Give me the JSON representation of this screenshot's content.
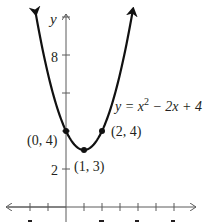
{
  "chart_data": {
    "type": "line",
    "title": "",
    "xlabel": "",
    "ylabel": "y",
    "equation_label": "y = x² − 2x + 4",
    "function": "x^2 - 2x + 4",
    "x_range": [
      -1.7,
      3.7
    ],
    "xlim": [
      -3.4,
      7.2
    ],
    "ylim": [
      -0.8,
      11
    ],
    "x_ticks": [
      -2,
      -1,
      1,
      2,
      3,
      4,
      5,
      6
    ],
    "y_ticks": [
      2,
      4,
      6,
      8,
      10
    ],
    "y_tick_labels": [
      {
        "value": 2,
        "label": "2"
      },
      {
        "value": 8,
        "label": "8"
      }
    ],
    "grid": false,
    "series": [
      {
        "name": "y = x² − 2x + 4",
        "x": [
          -1.5,
          -1,
          0,
          1,
          2,
          3,
          3.5
        ],
        "values": [
          9.25,
          7,
          4,
          3,
          4,
          7,
          9.25
        ]
      }
    ],
    "points": [
      {
        "x": 0,
        "y": 4,
        "label": "(0, 4)"
      },
      {
        "x": 1,
        "y": 3,
        "label": "(1, 3)"
      },
      {
        "x": 2,
        "y": 4,
        "label": "(2, 4)"
      }
    ]
  },
  "labels": {
    "y_axis": "y",
    "tick_8": "8",
    "tick_2": "2",
    "equation": "y = x",
    "equation_exp": "2",
    "equation_rest": " − 2x + 4",
    "point_0_4": "(0, 4)",
    "point_1_3": "(1, 3)",
    "point_2_4": "(2, 4)"
  },
  "colors": {
    "curve": "#111111",
    "axis": "#5a5a5a",
    "text": "#231f20"
  }
}
